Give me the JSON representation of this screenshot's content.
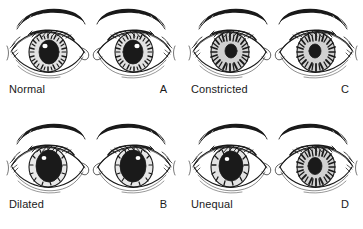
{
  "figure": {
    "background_color": "#ffffff",
    "ink_color": "#1a1a1a",
    "layout": "2x2 grid of eye-pair panels",
    "panels": [
      {
        "id": "normal",
        "name": "Normal",
        "letter": "A",
        "row": 0,
        "column": 0,
        "left_pupil": "medium",
        "right_pupil": "medium",
        "symmetric": "yes"
      },
      {
        "id": "constricted",
        "name": "Constricted",
        "letter": "C",
        "row": 0,
        "column": 1,
        "left_pupil": "small",
        "right_pupil": "small",
        "symmetric": "yes"
      },
      {
        "id": "dilated",
        "name": "Dilated",
        "letter": "B",
        "row": 1,
        "column": 0,
        "left_pupil": "large",
        "right_pupil": "large",
        "symmetric": "yes"
      },
      {
        "id": "unequal",
        "name": "Unequal",
        "letter": "D",
        "row": 1,
        "column": 1,
        "left_pupil": "large",
        "right_pupil": "small",
        "symmetric": "no"
      }
    ]
  }
}
